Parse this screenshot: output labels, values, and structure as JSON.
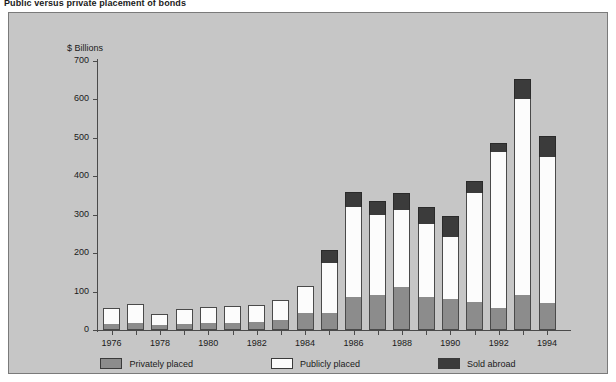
{
  "chart_data": {
    "type": "bar",
    "subtype": "stacked-vertical",
    "title": "Public versus private placement of bonds",
    "xlabel": "",
    "ylabel": "$ Billions",
    "ylim": [
      0,
      700
    ],
    "yticks": [
      0,
      100,
      200,
      300,
      400,
      500,
      600,
      700
    ],
    "ytick_labels": [
      "0",
      "100",
      "200",
      "300",
      "400",
      "500",
      "600",
      "700"
    ],
    "grid": false,
    "legend_position": "bottom",
    "categories": [
      "1976",
      "1977",
      "1978",
      "1979",
      "1980",
      "1981",
      "1982",
      "1983",
      "1984",
      "1985",
      "1986",
      "1987",
      "1988",
      "1989",
      "1990",
      "1991",
      "1992",
      "1993",
      "1994"
    ],
    "xtick_labels": [
      "1976",
      "1978",
      "1980",
      "1982",
      "1984",
      "1986",
      "1988",
      "1990",
      "1992",
      "1994"
    ],
    "series": [
      {
        "name": "Privately placed",
        "color": "#8c8c8c",
        "values": [
          16,
          18,
          12,
          16,
          18,
          18,
          20,
          25,
          44,
          44,
          85,
          90,
          112,
          86,
          82,
          72,
          57,
          92,
          70
        ]
      },
      {
        "name": "Publicly placed",
        "color": "#fcfcfc",
        "values": [
          42,
          50,
          30,
          40,
          42,
          44,
          46,
          52,
          70,
          130,
          235,
          210,
          200,
          190,
          160,
          285,
          405,
          510,
          380
        ]
      },
      {
        "name": "Sold abroad",
        "color": "#3b3b3b",
        "values": [
          0,
          0,
          0,
          0,
          0,
          0,
          0,
          0,
          0,
          35,
          40,
          35,
          45,
          45,
          55,
          30,
          25,
          52,
          55
        ]
      }
    ],
    "totals": [
      58,
      68,
      42,
      56,
      60,
      62,
      66,
      77,
      114,
      209,
      360,
      335,
      357,
      321,
      297,
      387,
      487,
      654,
      505
    ]
  },
  "legend": {
    "items": [
      {
        "label": "Privately placed",
        "swatch": "#8c8c8c"
      },
      {
        "label": "Publicly placed",
        "swatch": "#fcfcfc"
      },
      {
        "label": "Sold abroad",
        "swatch": "#3b3b3b"
      }
    ]
  },
  "colors": {
    "panel_background": "#c6c6c6",
    "page_background": "#ffffff",
    "axis": "#4a4a4a",
    "text": "#1a1a1a"
  }
}
